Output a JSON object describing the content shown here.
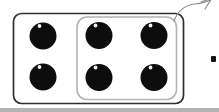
{
  "figure": {
    "canvas": {
      "width": 219,
      "height": 112
    },
    "dot_count": 6,
    "grouped_dot_count": 4,
    "card": {
      "x": 13.5,
      "y": 13.5,
      "width": 170,
      "height": 90,
      "radius": 8
    },
    "group_outline": {
      "x": 77,
      "y": 17,
      "width": 99.5,
      "height": 82.5,
      "radius": 10
    },
    "dot_radius": 13.5,
    "dot_highlight": {
      "dx": -3.5,
      "dy": -10,
      "r": 1.9
    },
    "dots": [
      {
        "cx": 43,
        "cy": 36,
        "grouped": false
      },
      {
        "cx": 99,
        "cy": 35.5,
        "grouped": true
      },
      {
        "cx": 154,
        "cy": 35.5,
        "grouped": true
      },
      {
        "cx": 43,
        "cy": 77,
        "grouped": false
      },
      {
        "cx": 99,
        "cy": 77.5,
        "grouped": true
      },
      {
        "cx": 154,
        "cy": 77.5,
        "grouped": true
      }
    ],
    "leader_line": {
      "curve_path": "M 174 21 C 178 10 185 5 195 4 C 202 3.5 208 2 213 -2",
      "arrowhead_path": "M 201 2 L 212 -2 L 205 9"
    },
    "edge_mark": {
      "x": 211,
      "y": 56,
      "width": 5,
      "height": 6,
      "radius": 1
    },
    "bottom_strip": {
      "x": 0,
      "y": 108,
      "width": 219,
      "height": 4
    },
    "colors": {
      "background": "#ffffff",
      "card_border": "#2f2f2f",
      "group_border": "#b3b3b3",
      "dot_fill": "#0d0d0d",
      "dot_highlight": "#ffffff",
      "leader_line": "#8c8c8c",
      "edge_mark": "#151515",
      "bottom_strip": "#b4b4b4"
    }
  }
}
